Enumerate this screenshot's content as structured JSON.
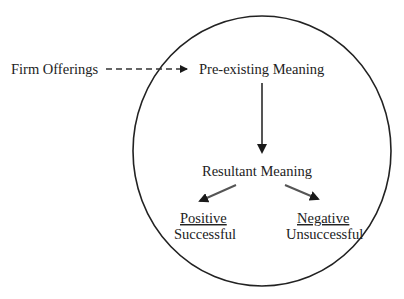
{
  "diagram": {
    "nodes": {
      "firm_offerings": "Firm Offerings",
      "pre_existing": "Pre-existing Meaning",
      "resultant": "Resultant Meaning",
      "positive_heading": "Positive",
      "positive_sub": "Successful",
      "negative_heading": "Negative",
      "negative_sub": "Unsuccessful"
    },
    "edges": [
      {
        "from": "Firm Offerings",
        "to": "Pre-existing Meaning",
        "style": "dashed"
      },
      {
        "from": "Pre-existing Meaning",
        "to": "Resultant Meaning",
        "style": "solid"
      },
      {
        "from": "Resultant Meaning",
        "to": "Positive / Successful",
        "style": "solid"
      },
      {
        "from": "Resultant Meaning",
        "to": "Negative / Unsuccessful",
        "style": "solid"
      }
    ],
    "enclosure": "circle",
    "colors": {
      "line": "#222222",
      "arrow": "#444444",
      "background": "#ffffff"
    }
  }
}
